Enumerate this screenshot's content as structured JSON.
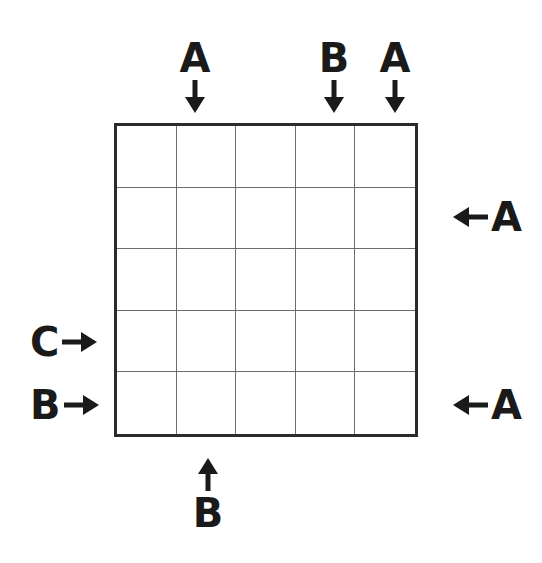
{
  "figure": {
    "type": "grid-puzzle-diagram",
    "background_color": "#ffffff",
    "ink_color": "#1a1a1a"
  },
  "grid": {
    "columns": 5,
    "rows": 5,
    "outer_border_color": "#2b2b2b",
    "inner_line_color": "#6d6d6d",
    "cells": [
      [
        "",
        "",
        "",
        "",
        ""
      ],
      [
        "",
        "",
        "",
        "",
        ""
      ],
      [
        "",
        "",
        "",
        "",
        ""
      ],
      [
        "",
        "",
        "",
        "",
        ""
      ],
      [
        "",
        "",
        "",
        "",
        ""
      ]
    ]
  },
  "clues": {
    "top": [
      {
        "label": "A",
        "column": 2,
        "direction": "down",
        "arrow_glyph": "↓"
      },
      {
        "label": "B",
        "column": 4,
        "direction": "down",
        "arrow_glyph": "↓"
      },
      {
        "label": "A",
        "column": 5,
        "direction": "down",
        "arrow_glyph": "↓"
      }
    ],
    "bottom": [
      {
        "label": "B",
        "column": 2,
        "direction": "up",
        "arrow_glyph": "↑"
      }
    ],
    "left": [
      {
        "label": "C",
        "row": 4,
        "direction": "right",
        "arrow_glyph": "→"
      },
      {
        "label": "B",
        "row": 5,
        "direction": "right",
        "arrow_glyph": "→"
      }
    ],
    "right": [
      {
        "label": "A",
        "row": 2,
        "direction": "left",
        "arrow_glyph": "←"
      },
      {
        "label": "A",
        "row": 5,
        "direction": "left",
        "arrow_glyph": "←"
      }
    ]
  }
}
